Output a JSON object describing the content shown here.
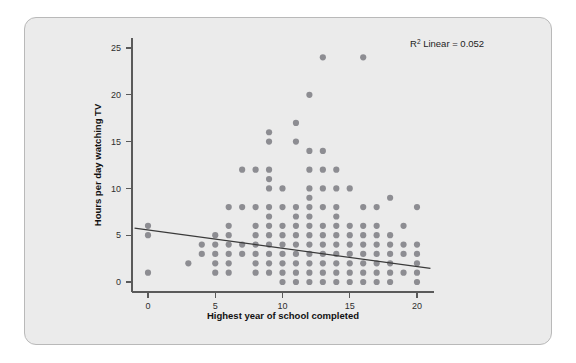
{
  "figure": {
    "background_color": "#ebebeb",
    "border_color": "#b9b9b9",
    "marker_color": "#8d8d92",
    "line_color": "#3a3a3a",
    "annotation_prefix": "R",
    "annotation_superscript": "2",
    "annotation_suffix": " Linear = 0.052"
  },
  "chart_data": {
    "type": "scatter",
    "title": "",
    "xlabel": "Highest year of school completed",
    "ylabel": "Hours per day watching TV",
    "xlim": [
      -1,
      21
    ],
    "ylim": [
      -1.5,
      26.5
    ],
    "xticks": [
      0,
      5,
      10,
      15,
      20
    ],
    "xticklabels": [
      "0",
      "5",
      "10",
      "15",
      "20"
    ],
    "yticks": [
      0,
      5,
      10,
      15,
      20,
      25
    ],
    "yticklabels": [
      "0",
      "5",
      "10",
      "15",
      "20",
      "25"
    ],
    "grid": false,
    "legend": null,
    "annotations": [
      {
        "text": "R² Linear = 0.052",
        "x": 17.5,
        "y": 25.4,
        "r_squared": 0.052,
        "fit": "Linear"
      }
    ],
    "fit_line": {
      "type": "linear",
      "x_start": -1,
      "y_start": 5.75,
      "x_end": 21,
      "y_end": 1.45
    },
    "points": [
      [
        0,
        6
      ],
      [
        0,
        5
      ],
      [
        0,
        1
      ],
      [
        3,
        2
      ],
      [
        4,
        4
      ],
      [
        4,
        3
      ],
      [
        5,
        5
      ],
      [
        5,
        4
      ],
      [
        5,
        3
      ],
      [
        5,
        2
      ],
      [
        5,
        1
      ],
      [
        6,
        8
      ],
      [
        6,
        6
      ],
      [
        6,
        5
      ],
      [
        6,
        4
      ],
      [
        6,
        3
      ],
      [
        6,
        2
      ],
      [
        6,
        1
      ],
      [
        7,
        12
      ],
      [
        7,
        8
      ],
      [
        7,
        4
      ],
      [
        7,
        3
      ],
      [
        8,
        12
      ],
      [
        8,
        8
      ],
      [
        8,
        6
      ],
      [
        8,
        5
      ],
      [
        8,
        4
      ],
      [
        8,
        3
      ],
      [
        8,
        2
      ],
      [
        8,
        1
      ],
      [
        9,
        16
      ],
      [
        9,
        15
      ],
      [
        9,
        12
      ],
      [
        9,
        11
      ],
      [
        9,
        10
      ],
      [
        9,
        8
      ],
      [
        9,
        7
      ],
      [
        9,
        6
      ],
      [
        9,
        5
      ],
      [
        9,
        4
      ],
      [
        9,
        3
      ],
      [
        9,
        2
      ],
      [
        9,
        1
      ],
      [
        10,
        10
      ],
      [
        10,
        8
      ],
      [
        10,
        6
      ],
      [
        10,
        5
      ],
      [
        10,
        4
      ],
      [
        10,
        3
      ],
      [
        10,
        2
      ],
      [
        10,
        1
      ],
      [
        10,
        0
      ],
      [
        11,
        17
      ],
      [
        11,
        15
      ],
      [
        11,
        8
      ],
      [
        11,
        7
      ],
      [
        11,
        6
      ],
      [
        11,
        5
      ],
      [
        11,
        4
      ],
      [
        11,
        3
      ],
      [
        11,
        2
      ],
      [
        11,
        1
      ],
      [
        11,
        0
      ],
      [
        12,
        20
      ],
      [
        12,
        14
      ],
      [
        12,
        12
      ],
      [
        12,
        10
      ],
      [
        12,
        9
      ],
      [
        12,
        8
      ],
      [
        12,
        7
      ],
      [
        12,
        6
      ],
      [
        12,
        5
      ],
      [
        12,
        4
      ],
      [
        12,
        3
      ],
      [
        12,
        2
      ],
      [
        12,
        1
      ],
      [
        12,
        0
      ],
      [
        13,
        24
      ],
      [
        13,
        14
      ],
      [
        13,
        12
      ],
      [
        13,
        10
      ],
      [
        13,
        8
      ],
      [
        13,
        6
      ],
      [
        13,
        5
      ],
      [
        13,
        4
      ],
      [
        13,
        3
      ],
      [
        13,
        2
      ],
      [
        13,
        1
      ],
      [
        13,
        0
      ],
      [
        14,
        12
      ],
      [
        14,
        10
      ],
      [
        14,
        8
      ],
      [
        14,
        7
      ],
      [
        14,
        6
      ],
      [
        14,
        5
      ],
      [
        14,
        4
      ],
      [
        14,
        3
      ],
      [
        14,
        2
      ],
      [
        14,
        1
      ],
      [
        14,
        0
      ],
      [
        15,
        10
      ],
      [
        15,
        6
      ],
      [
        15,
        5
      ],
      [
        15,
        4
      ],
      [
        15,
        3
      ],
      [
        15,
        2
      ],
      [
        15,
        1
      ],
      [
        15,
        0
      ],
      [
        16,
        24
      ],
      [
        16,
        8
      ],
      [
        16,
        6
      ],
      [
        16,
        5
      ],
      [
        16,
        4
      ],
      [
        16,
        3
      ],
      [
        16,
        2
      ],
      [
        16,
        1
      ],
      [
        16,
        0
      ],
      [
        17,
        8
      ],
      [
        17,
        6
      ],
      [
        17,
        5
      ],
      [
        17,
        4
      ],
      [
        17,
        3
      ],
      [
        17,
        2
      ],
      [
        17,
        1
      ],
      [
        17,
        0
      ],
      [
        18,
        9
      ],
      [
        18,
        5
      ],
      [
        18,
        4
      ],
      [
        18,
        3
      ],
      [
        18,
        2
      ],
      [
        18,
        1
      ],
      [
        18,
        0
      ],
      [
        19,
        6
      ],
      [
        19,
        4
      ],
      [
        19,
        3
      ],
      [
        19,
        1
      ],
      [
        20,
        8
      ],
      [
        20,
        4
      ],
      [
        20,
        3
      ],
      [
        20,
        2
      ],
      [
        20,
        1
      ],
      [
        20,
        0
      ]
    ]
  }
}
